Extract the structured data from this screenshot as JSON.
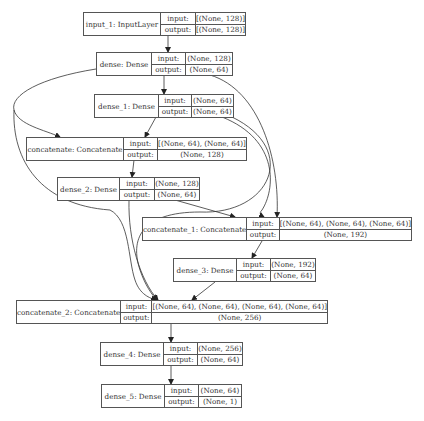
{
  "diagram": {
    "type": "keras-model-plot",
    "labels": {
      "input": "input:",
      "output": "output:"
    },
    "nodes": [
      {
        "id": "input_1",
        "name": "input_1: InputLayer",
        "input": "[(None, 128)]",
        "output": "[(None, 128)]"
      },
      {
        "id": "dense",
        "name": "dense: Dense",
        "input": "(None, 128)",
        "output": "(None, 64)"
      },
      {
        "id": "dense_1",
        "name": "dense_1: Dense",
        "input": "(None, 64)",
        "output": "(None, 64)"
      },
      {
        "id": "concatenate",
        "name": "concatenate: Concatenate",
        "input": "[(None, 64), (None, 64)]",
        "output": "(None, 128)"
      },
      {
        "id": "dense_2",
        "name": "dense_2: Dense",
        "input": "(None, 128)",
        "output": "(None, 64)"
      },
      {
        "id": "concatenate_1",
        "name": "concatenate_1: Concatenate",
        "input": "[(None, 64), (None, 64), (None, 64)]",
        "output": "(None, 192)"
      },
      {
        "id": "dense_3",
        "name": "dense_3: Dense",
        "input": "(None, 192)",
        "output": "(None, 64)"
      },
      {
        "id": "concatenate_2",
        "name": "concatenate_2: Concatenate",
        "input": "[(None, 64), (None, 64), (None, 64), (None, 64)]",
        "output": "(None, 256)"
      },
      {
        "id": "dense_4",
        "name": "dense_4: Dense",
        "input": "(None, 256)",
        "output": "(None, 64)"
      },
      {
        "id": "dense_5",
        "name": "dense_5: Dense",
        "input": "(None, 64)",
        "output": "(None, 1)"
      }
    ],
    "edges": [
      [
        "input_1",
        "dense"
      ],
      [
        "dense",
        "dense_1"
      ],
      [
        "dense",
        "concatenate"
      ],
      [
        "dense_1",
        "concatenate"
      ],
      [
        "concatenate",
        "dense_2"
      ],
      [
        "dense",
        "concatenate_1"
      ],
      [
        "dense_1",
        "concatenate_1"
      ],
      [
        "dense_2",
        "concatenate_1"
      ],
      [
        "concatenate_1",
        "dense_3"
      ],
      [
        "dense",
        "concatenate_2"
      ],
      [
        "dense_1",
        "concatenate_2"
      ],
      [
        "dense_2",
        "concatenate_2"
      ],
      [
        "dense_3",
        "concatenate_2"
      ],
      [
        "concatenate_2",
        "dense_4"
      ],
      [
        "dense_4",
        "dense_5"
      ]
    ]
  }
}
